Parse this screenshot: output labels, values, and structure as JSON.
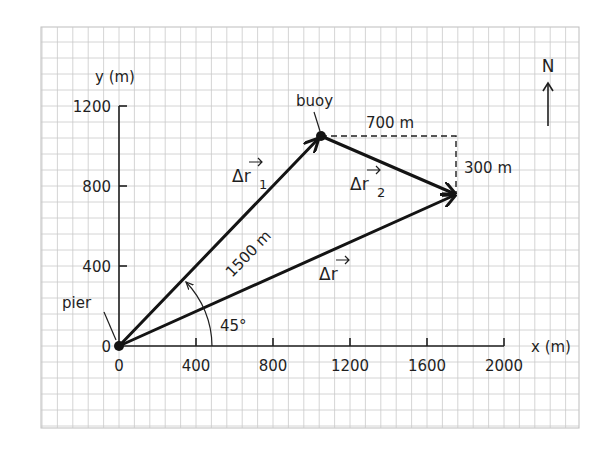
{
  "figure": {
    "axes": {
      "x_label": "x (m)",
      "y_label": "y (m)",
      "x_ticks": [
        "0",
        "400",
        "800",
        "1200",
        "1600",
        "2000"
      ],
      "y_ticks": [
        "0",
        "400",
        "800",
        "1200"
      ]
    },
    "points": {
      "pier": "pier",
      "buoy": "buoy"
    },
    "vectors": {
      "dr1": {
        "symbol": "Δr",
        "subscript": "1",
        "magnitude_label": "1500 m"
      },
      "dr2": {
        "symbol": "Δr",
        "subscript": "2"
      },
      "dr": {
        "symbol": "Δr"
      }
    },
    "components": {
      "horizontal": "700 m",
      "vertical": "300 m"
    },
    "angle_label": "45°",
    "compass_label": "N",
    "colors": {
      "ink": "#141414",
      "grid": "#c9c9c9",
      "background": "#ffffff"
    }
  }
}
